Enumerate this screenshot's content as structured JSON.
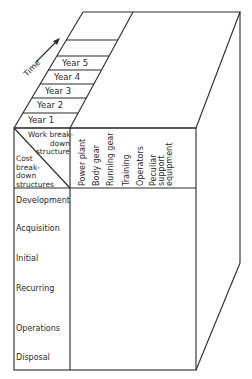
{
  "diagram": {
    "time_axis": {
      "label": "Time",
      "icon": "arrow-up-right-icon"
    },
    "years": [
      "Year 1",
      "Year 2",
      "Year 3",
      "Year 4",
      "Year 5"
    ],
    "corner_header": {
      "top_label": "Work break-\ndown\nstructure",
      "top_lines": [
        "Work break-",
        "down",
        "structure"
      ],
      "bottom_lines": [
        "Cost",
        "break-",
        "down",
        "structures"
      ]
    },
    "columns": [
      "Power plant",
      "Body gear",
      "Running gear",
      "Training",
      "Operators",
      "Peculiar",
      "support",
      "equipment"
    ],
    "column_groups": [
      {
        "lines": [
          "Power plant"
        ]
      },
      {
        "lines": [
          "Body gear"
        ]
      },
      {
        "lines": [
          "Running gear"
        ]
      },
      {
        "lines": [
          "Training"
        ]
      },
      {
        "lines": [
          "Operators"
        ]
      },
      {
        "lines": [
          "Peculiar",
          "support",
          "equipment"
        ]
      }
    ],
    "rows": [
      "Development",
      "Acquisition",
      "Initial",
      "Recurring",
      "Operations",
      "Disposal"
    ],
    "line_color": "#2a2a2a"
  }
}
